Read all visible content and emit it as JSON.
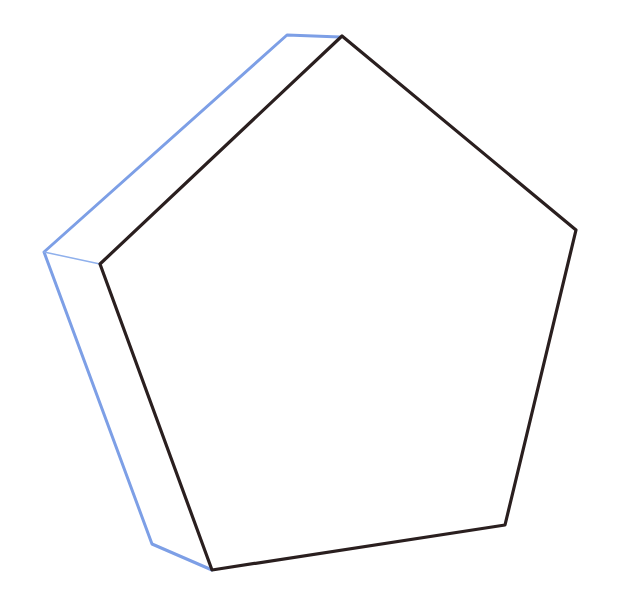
{
  "figure": {
    "width": 625,
    "height": 615,
    "background": "#ffffff",
    "front_face": {
      "color": "#2a1f1f",
      "stroke_width": 3.2,
      "points": [
        [
          342,
          36
        ],
        [
          576,
          230
        ],
        [
          505,
          525
        ],
        [
          212,
          570
        ],
        [
          100,
          264
        ]
      ]
    },
    "back_edges": {
      "color": "#7d9fe6",
      "stroke_width": 3,
      "outline": [
        [
          340,
          37
        ],
        [
          287,
          35
        ],
        [
          44,
          252
        ],
        [
          152,
          544
        ],
        [
          212,
          570
        ]
      ],
      "connector": {
        "color": "#8fb0ec",
        "stroke_width": 1.5,
        "from": [
          44,
          252
        ],
        "to": [
          100,
          264
        ]
      }
    }
  }
}
